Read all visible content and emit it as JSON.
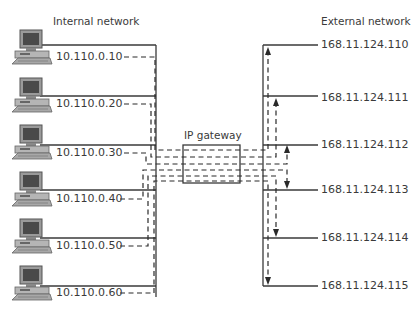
{
  "diagram": {
    "internal_title": "Internal network",
    "external_title": "External network",
    "gateway_label": "IP gateway",
    "internal_hosts": [
      {
        "ip": "10.110.0.10",
        "icon": "desktop-computer-icon"
      },
      {
        "ip": "10.110.0.20",
        "icon": "desktop-computer-icon"
      },
      {
        "ip": "10.110.0.30",
        "icon": "desktop-computer-icon"
      },
      {
        "ip": "10.110.0.40",
        "icon": "desktop-computer-icon"
      },
      {
        "ip": "10.110.0.50",
        "icon": "desktop-computer-icon"
      },
      {
        "ip": "10.110.0.60",
        "icon": "desktop-computer-icon"
      }
    ],
    "external_addresses": [
      {
        "ip": "168.11.124.110"
      },
      {
        "ip": "168.11.124.111"
      },
      {
        "ip": "168.11.124.112"
      },
      {
        "ip": "168.11.124.113"
      },
      {
        "ip": "168.11.124.114"
      },
      {
        "ip": "168.11.124.115"
      }
    ],
    "colors": {
      "line": "#3a3a3a",
      "text": "#3a3a3a",
      "background": "#ffffff"
    }
  }
}
